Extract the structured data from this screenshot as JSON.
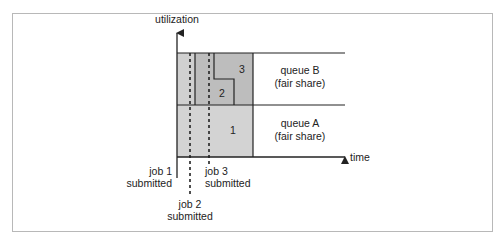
{
  "diagram": {
    "y_axis_label": "utilization",
    "x_axis_label": "time",
    "queues": [
      {
        "id": "B",
        "name": "queue B",
        "note": "(fair share)"
      },
      {
        "id": "A",
        "name": "queue A",
        "note": "(fair share)"
      }
    ],
    "jobs": [
      {
        "number": "1",
        "label_line1": "job 1",
        "label_line2": "submitted"
      },
      {
        "number": "2",
        "label_line1": "job 2",
        "label_line2": "submitted"
      },
      {
        "number": "3",
        "label_line1": "job 3",
        "label_line2": "submitted"
      }
    ],
    "colors": {
      "light_fill": "#d3d3d3",
      "dark_fill": "#bdbdbd",
      "line": "#222222",
      "frame": "#b8b8b8"
    }
  }
}
